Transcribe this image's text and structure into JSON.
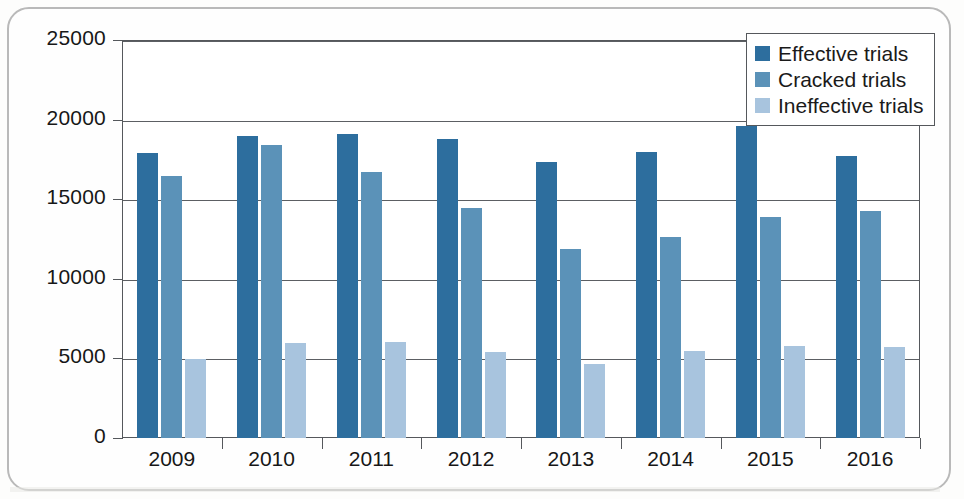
{
  "chart_data": {
    "type": "bar",
    "title": "",
    "xlabel": "",
    "ylabel": "",
    "categories": [
      "2009",
      "2010",
      "2011",
      "2012",
      "2013",
      "2014",
      "2015",
      "2016"
    ],
    "series": [
      {
        "name": "Effective trials",
        "color": "#2d6e9e",
        "values": [
          17900,
          18950,
          19100,
          18800,
          17350,
          17950,
          19600,
          17700
        ]
      },
      {
        "name": "Cracked trials",
        "color": "#5b92b8",
        "values": [
          16450,
          18400,
          16700,
          14450,
          11900,
          12650,
          13900,
          14250
        ]
      },
      {
        "name": "Ineffective trials",
        "color": "#a8c4de",
        "values": [
          4950,
          5950,
          6050,
          5400,
          4650,
          5450,
          5800,
          5700
        ]
      }
    ],
    "ylim": [
      0,
      25000
    ],
    "ytick_values": [
      0,
      5000,
      10000,
      15000,
      20000,
      25000
    ],
    "ytick_labels": [
      "0",
      "5000",
      "10000",
      "15000",
      "20000",
      "25000"
    ],
    "grid": true,
    "legend_position": "top-right"
  },
  "legend": {
    "items": [
      {
        "label": "Effective trials",
        "color": "#2d6e9e"
      },
      {
        "label": "Cracked trials",
        "color": "#5b92b8"
      },
      {
        "label": "Ineffective trials",
        "color": "#a8c4de"
      }
    ]
  }
}
